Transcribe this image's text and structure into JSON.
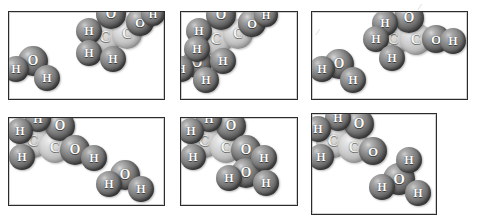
{
  "figure": {
    "panel_count": 6,
    "atom_colors": {
      "oxygen": "#6f6f6f",
      "hydrogen": "#8a8a8a",
      "carbon": "#cfcfcf",
      "label": "#ffffff",
      "frame": "#2b2b2b",
      "background": "#ffffff"
    },
    "legend_labels": {
      "oxygen": "O",
      "hydrogen": "H",
      "carbon": "C"
    },
    "panels": [
      {
        "id": "panel-1",
        "caption": "",
        "box": {
          "x": 8,
          "y": 11,
          "w": 157,
          "h": 89
        },
        "atoms": [
          {
            "el": "O",
            "label": "O",
            "x": 110,
            "y": 13,
            "r": 15
          },
          {
            "el": "H",
            "label": "H",
            "x": 88,
            "y": 30,
            "r": 13
          },
          {
            "el": "C",
            "label": "C",
            "x": 104,
            "y": 36,
            "r": 17
          },
          {
            "el": "C",
            "label": "C",
            "x": 126,
            "y": 33,
            "r": 15
          },
          {
            "el": "O",
            "label": "O",
            "x": 139,
            "y": 21,
            "r": 14
          },
          {
            "el": "H",
            "label": "H",
            "x": 152,
            "y": 13,
            "r": 12
          },
          {
            "el": "H",
            "label": "H",
            "x": 88,
            "y": 52,
            "r": 13
          },
          {
            "el": "H",
            "label": "H",
            "x": 112,
            "y": 58,
            "r": 13
          },
          {
            "el": "O",
            "label": "O",
            "x": 32,
            "y": 60,
            "r": 15
          },
          {
            "el": "H",
            "label": "H",
            "x": 15,
            "y": 68,
            "r": 13
          },
          {
            "el": "H",
            "label": "H",
            "x": 46,
            "y": 77,
            "r": 13
          }
        ]
      },
      {
        "id": "panel-2",
        "caption": "",
        "box": {
          "x": 180,
          "y": 11,
          "w": 118,
          "h": 89
        },
        "atoms": [
          {
            "el": "O",
            "label": "O",
            "x": 220,
            "y": 14,
            "r": 15
          },
          {
            "el": "H",
            "label": "H",
            "x": 198,
            "y": 30,
            "r": 13
          },
          {
            "el": "C",
            "label": "C",
            "x": 215,
            "y": 38,
            "r": 17
          },
          {
            "el": "C",
            "label": "C",
            "x": 237,
            "y": 33,
            "r": 15
          },
          {
            "el": "O",
            "label": "O",
            "x": 251,
            "y": 22,
            "r": 14
          },
          {
            "el": "H",
            "label": "H",
            "x": 265,
            "y": 14,
            "r": 12
          },
          {
            "el": "H",
            "label": "H",
            "x": 196,
            "y": 48,
            "r": 13
          },
          {
            "el": "H",
            "label": "H",
            "x": 222,
            "y": 60,
            "r": 13
          },
          {
            "el": "O",
            "label": "O",
            "x": 196,
            "y": 62,
            "r": 15
          },
          {
            "el": "H",
            "label": "H",
            "x": 180,
            "y": 68,
            "r": 13
          },
          {
            "el": "H",
            "label": "H",
            "x": 205,
            "y": 79,
            "r": 13
          }
        ]
      },
      {
        "id": "panel-3",
        "caption": "",
        "box": {
          "x": 311,
          "y": 11,
          "w": 157,
          "h": 89
        },
        "atoms": [
          {
            "el": "H",
            "label": "H",
            "x": 384,
            "y": 22,
            "r": 13
          },
          {
            "el": "O",
            "label": "O",
            "x": 408,
            "y": 17,
            "r": 15
          },
          {
            "el": "H",
            "label": "H",
            "x": 375,
            "y": 38,
            "r": 13
          },
          {
            "el": "C",
            "label": "C",
            "x": 392,
            "y": 38,
            "r": 17
          },
          {
            "el": "C",
            "label": "C",
            "x": 415,
            "y": 38,
            "r": 16
          },
          {
            "el": "O",
            "label": "O",
            "x": 435,
            "y": 38,
            "r": 14
          },
          {
            "el": "H",
            "label": "H",
            "x": 452,
            "y": 40,
            "r": 13
          },
          {
            "el": "H",
            "label": "H",
            "x": 391,
            "y": 57,
            "r": 13
          },
          {
            "el": "H",
            "label": "H",
            "x": 321,
            "y": 68,
            "r": 13
          },
          {
            "el": "O",
            "label": "O",
            "x": 338,
            "y": 63,
            "r": 15
          },
          {
            "el": "H",
            "label": "H",
            "x": 352,
            "y": 79,
            "r": 13
          }
        ]
      },
      {
        "id": "panel-4",
        "caption": "",
        "box": {
          "x": 8,
          "y": 117,
          "w": 157,
          "h": 89
        },
        "atoms": [
          {
            "el": "H",
            "label": "H",
            "x": 37,
            "y": 118,
            "r": 13
          },
          {
            "el": "H",
            "label": "H",
            "x": 19,
            "y": 130,
            "r": 13
          },
          {
            "el": "O",
            "label": "O",
            "x": 59,
            "y": 125,
            "r": 15
          },
          {
            "el": "C",
            "label": "C",
            "x": 32,
            "y": 140,
            "r": 17
          },
          {
            "el": "C",
            "label": "C",
            "x": 54,
            "y": 146,
            "r": 16
          },
          {
            "el": "H",
            "label": "H",
            "x": 21,
            "y": 156,
            "r": 13
          },
          {
            "el": "O",
            "label": "O",
            "x": 74,
            "y": 149,
            "r": 15
          },
          {
            "el": "H",
            "label": "H",
            "x": 93,
            "y": 157,
            "r": 13
          },
          {
            "el": "H",
            "label": "H",
            "x": 108,
            "y": 183,
            "r": 13
          },
          {
            "el": "O",
            "label": "O",
            "x": 124,
            "y": 174,
            "r": 15
          },
          {
            "el": "H",
            "label": "H",
            "x": 140,
            "y": 188,
            "r": 13
          }
        ]
      },
      {
        "id": "panel-5",
        "caption": "",
        "box": {
          "x": 180,
          "y": 117,
          "w": 118,
          "h": 89
        },
        "atoms": [
          {
            "el": "H",
            "label": "H",
            "x": 208,
            "y": 118,
            "r": 13
          },
          {
            "el": "H",
            "label": "H",
            "x": 190,
            "y": 130,
            "r": 13
          },
          {
            "el": "O",
            "label": "O",
            "x": 230,
            "y": 125,
            "r": 15
          },
          {
            "el": "C",
            "label": "C",
            "x": 203,
            "y": 140,
            "r": 17
          },
          {
            "el": "C",
            "label": "C",
            "x": 225,
            "y": 146,
            "r": 16
          },
          {
            "el": "H",
            "label": "H",
            "x": 192,
            "y": 156,
            "r": 13
          },
          {
            "el": "O",
            "label": "O",
            "x": 245,
            "y": 149,
            "r": 15
          },
          {
            "el": "H",
            "label": "H",
            "x": 263,
            "y": 157,
            "r": 13
          },
          {
            "el": "H",
            "label": "H",
            "x": 228,
            "y": 177,
            "r": 13
          },
          {
            "el": "O",
            "label": "O",
            "x": 245,
            "y": 172,
            "r": 15
          },
          {
            "el": "H",
            "label": "H",
            "x": 265,
            "y": 182,
            "r": 13
          }
        ]
      },
      {
        "id": "panel-6",
        "caption": "",
        "box": {
          "x": 311,
          "y": 113,
          "w": 126,
          "h": 102
        },
        "atoms": [
          {
            "el": "H",
            "label": "H",
            "x": 337,
            "y": 117,
            "r": 13
          },
          {
            "el": "H",
            "label": "H",
            "x": 317,
            "y": 128,
            "r": 13
          },
          {
            "el": "O",
            "label": "O",
            "x": 358,
            "y": 123,
            "r": 15
          },
          {
            "el": "C",
            "label": "C",
            "x": 332,
            "y": 140,
            "r": 17
          },
          {
            "el": "C",
            "label": "C",
            "x": 353,
            "y": 146,
            "r": 16
          },
          {
            "el": "H",
            "label": "H",
            "x": 320,
            "y": 156,
            "r": 13
          },
          {
            "el": "O",
            "label": "O",
            "x": 372,
            "y": 150,
            "r": 14
          },
          {
            "el": "H",
            "label": "H",
            "x": 408,
            "y": 159,
            "r": 13
          },
          {
            "el": "O",
            "label": "O",
            "x": 398,
            "y": 178,
            "r": 16
          },
          {
            "el": "H",
            "label": "H",
            "x": 381,
            "y": 186,
            "r": 13
          },
          {
            "el": "H",
            "label": "H",
            "x": 417,
            "y": 192,
            "r": 13
          }
        ]
      }
    ],
    "stray_marks": [
      {
        "id": "mark-top-right",
        "glyph": "⁄",
        "x": 419,
        "y": 2
      },
      {
        "id": "mark-panel3-inner",
        "glyph": "⁄",
        "x": 317,
        "y": 27
      }
    ]
  }
}
